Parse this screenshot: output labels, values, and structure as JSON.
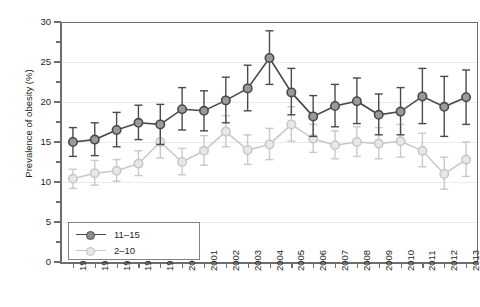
{
  "chart_data": {
    "type": "line",
    "title": "",
    "xlabel": "",
    "ylabel": "Prevalence of obesity (%)",
    "ylim": [
      0,
      30
    ],
    "ytick_values": [
      0,
      5,
      10,
      15,
      20,
      25,
      30
    ],
    "ytick_labels": [
      "0",
      "5",
      "10",
      "15",
      "20",
      "25",
      "30"
    ],
    "grid": true,
    "legend_position": "lower left",
    "categories": [
      "1995",
      "1996",
      "1997",
      "1998",
      "1999",
      "2000",
      "2001",
      "2002",
      "2003",
      "2004",
      "2005",
      "2006",
      "2007",
      "2008",
      "2009",
      "2010",
      "2011",
      "2012",
      "2013"
    ],
    "series": [
      {
        "name": "11–15",
        "color": "#4a4a4a",
        "marker_fill": "#9a9a9a",
        "values": [
          15.0,
          15.3,
          16.5,
          17.4,
          17.2,
          19.1,
          18.9,
          20.2,
          21.7,
          25.5,
          21.2,
          18.2,
          19.5,
          20.1,
          18.4,
          18.8,
          20.7,
          19.4,
          20.6
        ],
        "error_low": [
          13.2,
          13.3,
          14.4,
          15.3,
          14.7,
          16.5,
          16.4,
          17.4,
          18.9,
          22.2,
          18.4,
          15.7,
          16.9,
          17.3,
          15.9,
          15.9,
          17.3,
          15.7,
          17.2
        ],
        "error_high": [
          16.8,
          17.4,
          18.7,
          19.6,
          19.7,
          21.8,
          21.4,
          23.1,
          24.6,
          28.9,
          24.2,
          20.8,
          22.2,
          23.0,
          21.0,
          21.8,
          24.2,
          23.2,
          24.0
        ]
      },
      {
        "name": "2–10",
        "color": "#c9c9c9",
        "marker_fill": "#e8e8e8",
        "values": [
          10.4,
          11.1,
          11.4,
          12.3,
          15.0,
          12.5,
          13.9,
          16.3,
          14.0,
          14.7,
          17.2,
          15.4,
          14.6,
          15.0,
          14.8,
          15.1,
          13.9,
          11.0,
          12.8
        ],
        "error_low": [
          9.2,
          9.6,
          10.1,
          10.8,
          13.0,
          10.9,
          12.1,
          14.4,
          12.2,
          12.8,
          15.1,
          13.7,
          12.9,
          13.2,
          12.9,
          13.1,
          11.9,
          9.1,
          10.7
        ],
        "error_high": [
          11.6,
          12.7,
          12.8,
          13.9,
          17.1,
          14.2,
          15.8,
          18.3,
          15.9,
          16.7,
          19.4,
          17.2,
          16.4,
          16.9,
          16.8,
          17.2,
          16.1,
          13.1,
          15.0
        ]
      }
    ]
  }
}
